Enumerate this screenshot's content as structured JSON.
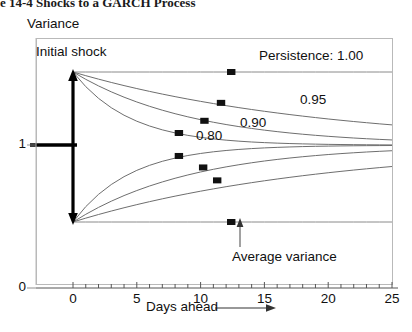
{
  "figure": {
    "title": "e 14-4 Shocks to a GARCH Process",
    "y_axis_title": "Variance",
    "x_axis_title": "Days ahead"
  },
  "annotations": {
    "initial_shock": "Initial shock",
    "persistence": "Persistence: 1.00",
    "average_variance": "Average variance"
  },
  "axis": {
    "y_ticks": [
      "1",
      "0"
    ],
    "x_ticks": [
      "0",
      "5",
      "10",
      "15",
      "20",
      "25"
    ]
  },
  "curve_labels": {
    "p080": "0.80",
    "p090": "0.90",
    "p095": "0.95"
  },
  "chart_data": {
    "type": "line",
    "title": "e 14-4 Shocks to a GARCH Process",
    "xlabel": "Days ahead",
    "ylabel": "Variance",
    "xlim": [
      0,
      25
    ],
    "ylim": [
      0,
      1.72
    ],
    "xticks": [
      0,
      5,
      10,
      15,
      20,
      25
    ],
    "xtick_labels": [
      "0",
      "5",
      "10",
      "15",
      "20",
      "25"
    ],
    "yticks": [
      0,
      1
    ],
    "ytick_labels": [
      "0",
      "1"
    ],
    "minor_x_tick_step": 1,
    "grid": false,
    "legend": "inline curve labels",
    "average_variance_level": 1.0,
    "initial_shock_upper": 1.51,
    "initial_shock_lower": 0.465,
    "x": [
      0,
      1,
      2,
      3,
      4,
      5,
      6,
      7,
      8,
      9,
      10,
      11,
      12,
      13,
      14,
      15,
      16,
      17,
      18,
      19,
      20,
      21,
      22,
      23,
      24,
      25
    ],
    "series": [
      {
        "name": "Persistence: 1.00 (upper)",
        "persistence": 1.0,
        "label": "Persistence: 1.00",
        "marker_point": {
          "x": 12.4,
          "y": 1.51
        },
        "values": [
          1.51,
          1.51,
          1.51,
          1.51,
          1.51,
          1.51,
          1.51,
          1.51,
          1.51,
          1.51,
          1.51,
          1.51,
          1.51,
          1.51,
          1.51,
          1.51,
          1.51,
          1.51,
          1.51,
          1.51,
          1.51,
          1.51,
          1.51,
          1.51,
          1.51,
          1.51
        ]
      },
      {
        "name": "Persistence 0.95 (upper)",
        "persistence": 0.95,
        "label": "0.95",
        "marker_point": {
          "x": 11.6,
          "y": 1.295
        },
        "values": [
          1.51,
          1.4845,
          1.4603,
          1.4373,
          1.4154,
          1.3946,
          1.3749,
          1.3562,
          1.3384,
          1.3214,
          1.3054,
          1.2901,
          1.2756,
          1.2618,
          1.2487,
          1.2363,
          1.2245,
          1.2133,
          1.2026,
          1.1925,
          1.1828,
          1.1737,
          1.165,
          1.1568,
          1.1489,
          1.1415
        ]
      },
      {
        "name": "Persistence 0.90 (upper)",
        "persistence": 0.9,
        "label": "0.90",
        "marker_point": {
          "x": 10.3,
          "y": 1.17
        },
        "values": [
          1.51,
          1.459,
          1.4131,
          1.3718,
          1.3346,
          1.3012,
          1.271,
          1.2439,
          1.2195,
          1.1976,
          1.1778,
          1.16,
          1.144,
          1.1296,
          1.1167,
          1.105,
          1.0945,
          1.085,
          1.0765,
          1.0689,
          1.062,
          1.0558,
          1.0502,
          1.0452,
          1.0407,
          1.0366
        ]
      },
      {
        "name": "Persistence 0.80 (upper)",
        "persistence": 0.8,
        "label": "0.80",
        "marker_point": {
          "x": 8.3,
          "y": 1.085
        },
        "values": [
          1.51,
          1.408,
          1.3264,
          1.2611,
          1.2089,
          1.1671,
          1.1337,
          1.107,
          1.0856,
          1.0685,
          1.0548,
          1.0438,
          1.0351,
          1.0281,
          1.0224,
          1.018,
          1.0144,
          1.0115,
          1.0092,
          1.0074,
          1.0059,
          1.0047,
          1.0038,
          1.003,
          1.0024,
          1.0019
        ]
      },
      {
        "name": "Persistence 0.80 (lower)",
        "persistence": 0.8,
        "marker_point": {
          "x": 8.3,
          "y": 0.925
        },
        "values": [
          0.465,
          0.572,
          0.6576,
          0.7261,
          0.7809,
          0.8247,
          0.8597,
          0.8878,
          0.9102,
          0.9282,
          0.9425,
          0.954,
          0.9632,
          0.9706,
          0.9765,
          0.9812,
          0.9849,
          0.9879,
          0.9904,
          0.9923,
          0.9938,
          0.9951,
          0.996,
          0.9968,
          0.9974,
          0.9979
        ]
      },
      {
        "name": "Persistence 0.90 (lower)",
        "persistence": 0.9,
        "marker_point": {
          "x": 10.2,
          "y": 0.845
        },
        "values": [
          0.465,
          0.5185,
          0.5667,
          0.61,
          0.649,
          0.6841,
          0.7157,
          0.7441,
          0.7697,
          0.7927,
          0.8135,
          0.8321,
          0.8489,
          0.864,
          0.8776,
          0.8899,
          0.9009,
          0.9108,
          0.9197,
          0.9277,
          0.935,
          0.9415,
          0.9473,
          0.9526,
          0.9573,
          0.9616
        ]
      },
      {
        "name": "Persistence 0.95 (lower)",
        "persistence": 0.95,
        "marker_point": {
          "x": 11.3,
          "y": 0.755
        },
        "values": [
          0.465,
          0.4918,
          0.5172,
          0.5413,
          0.5642,
          0.586,
          0.6067,
          0.6264,
          0.6451,
          0.6628,
          0.6797,
          0.6957,
          0.7109,
          0.7253,
          0.7391,
          0.7521,
          0.7645,
          0.7763,
          0.7875,
          0.7981,
          0.8082,
          0.8178,
          0.8269,
          0.8355,
          0.8438,
          0.8516
        ]
      },
      {
        "name": "Persistence 1.00 (lower)",
        "persistence": 1.0,
        "label": "Average variance",
        "marker_point": {
          "x": 12.4,
          "y": 0.465
        },
        "values": [
          0.465,
          0.465,
          0.465,
          0.465,
          0.465,
          0.465,
          0.465,
          0.465,
          0.465,
          0.465,
          0.465,
          0.465,
          0.465,
          0.465,
          0.465,
          0.465,
          0.465,
          0.465,
          0.465,
          0.465,
          0.465,
          0.465,
          0.465,
          0.465,
          0.465,
          0.465
        ]
      }
    ]
  }
}
